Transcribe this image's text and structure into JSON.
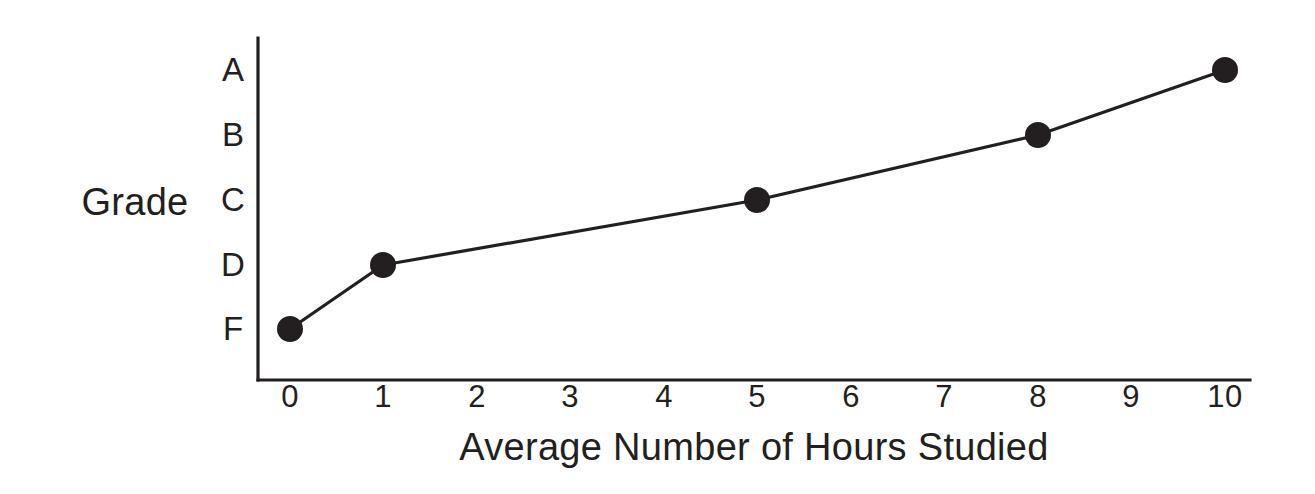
{
  "chart_data": {
    "type": "line",
    "title": "",
    "xlabel": "Average Number of Hours Studied",
    "ylabel": "Grade",
    "x": [
      0,
      1,
      5,
      8,
      10
    ],
    "values": [
      "F",
      "D",
      "C",
      "B",
      "A"
    ],
    "points": [
      {
        "x": 0,
        "y": "F"
      },
      {
        "x": 1,
        "y": "D"
      },
      {
        "x": 5,
        "y": "C"
      },
      {
        "x": 8,
        "y": "B"
      },
      {
        "x": 10,
        "y": "A"
      }
    ],
    "xticklabels": [
      "0",
      "1",
      "2",
      "3",
      "4",
      "5",
      "6",
      "7",
      "8",
      "9",
      "10"
    ],
    "yticklabels": [
      "A",
      "B",
      "C",
      "D",
      "F"
    ],
    "xlim": [
      0,
      10
    ],
    "ylim": [
      "F",
      "A"
    ],
    "grid": false,
    "legend": null,
    "marker": "filled-circle",
    "colors": {
      "line": "#231f20",
      "marker": "#231f20",
      "axis": "#231f20",
      "background": "#ffffff"
    }
  },
  "axes": {
    "x_title": "Average Number of Hours Studied",
    "y_title": "Grade"
  },
  "ticks": {
    "x": [
      {
        "label": "0",
        "px": 290
      },
      {
        "label": "1",
        "px": 383
      },
      {
        "label": "2",
        "px": 477
      },
      {
        "label": "3",
        "px": 570
      },
      {
        "label": "4",
        "px": 664
      },
      {
        "label": "5",
        "px": 757
      },
      {
        "label": "6",
        "px": 851
      },
      {
        "label": "7",
        "px": 944
      },
      {
        "label": "8",
        "px": 1038
      },
      {
        "label": "9",
        "px": 1131
      },
      {
        "label": "10",
        "px": 1225
      }
    ],
    "y": [
      {
        "label": "A",
        "px": 70
      },
      {
        "label": "B",
        "px": 135
      },
      {
        "label": "C",
        "px": 200
      },
      {
        "label": "D",
        "px": 265
      },
      {
        "label": "F",
        "px": 329
      }
    ]
  }
}
